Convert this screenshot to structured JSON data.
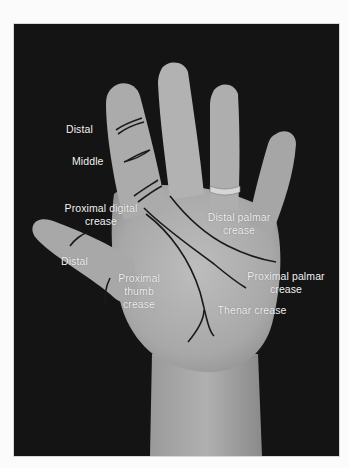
{
  "figure": {
    "colors": {
      "background": "#141414",
      "skin_light": "#b4b4b4",
      "skin_mid": "#9e9e9e",
      "crease_line": "#1a1a1a",
      "label_text": "#f2f2f2",
      "page": "#fbfbfb"
    },
    "labels": {
      "distal_finger": "Distal",
      "middle_finger": "Middle",
      "proximal_digital": "Proximal digital\ncrease",
      "distal_thumb": "Distal",
      "proximal_thumb": "Proximal\nthumb\ncrease",
      "distal_palmar": "Distal palmar\ncrease",
      "proximal_palmar": "Proximal palmar\ncrease",
      "thenar": "Thenar crease"
    }
  }
}
